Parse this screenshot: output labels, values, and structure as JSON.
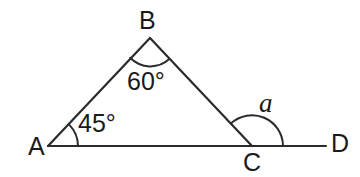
{
  "diagram": {
    "type": "geometry-triangle-exterior-angle",
    "background_color": "#ffffff",
    "stroke_color": "#2b2b2b",
    "text_color": "#1a1a1a",
    "vertices": [
      {
        "id": "A",
        "label": "A",
        "x": 48,
        "y": 146,
        "label_x": 28,
        "label_y": 134
      },
      {
        "id": "B",
        "label": "B",
        "x": 150,
        "y": 38,
        "label_x": 139,
        "label_y": 8
      },
      {
        "id": "C",
        "label": "C",
        "x": 252,
        "y": 146,
        "label_x": 243,
        "label_y": 150
      },
      {
        "id": "D",
        "label": "D",
        "x": 326,
        "y": 146,
        "label_x": 331,
        "label_y": 131
      }
    ],
    "segments": [
      {
        "name": "segment-AB",
        "from": "A",
        "to": "B"
      },
      {
        "name": "segment-BC",
        "from": "B",
        "to": "C"
      },
      {
        "name": "segment-AD",
        "from": "A",
        "to": "D"
      }
    ],
    "angles": [
      {
        "id": "angle-A",
        "at": "A",
        "label": "45°",
        "value": 45,
        "unit": "degrees",
        "arc_radius": 30,
        "label_x": 78,
        "label_y": 111
      },
      {
        "id": "angle-B",
        "at": "B",
        "label": "60°",
        "value": 60,
        "unit": "degrees",
        "arc_radius": 28,
        "label_x": 127,
        "label_y": 69
      },
      {
        "id": "angle-C-exterior",
        "at": "C",
        "label": "a",
        "value": null,
        "unit": "unknown",
        "arc_radius": 31,
        "label_x": 259,
        "label_y": 90
      }
    ]
  }
}
